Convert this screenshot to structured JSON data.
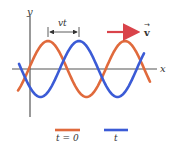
{
  "diagram": {
    "type": "traveling-wave",
    "axes": {
      "x_label": "x",
      "y_label": "y"
    },
    "displacement_label": "vt",
    "velocity_label": "v",
    "velocity_vector_mark": "→",
    "legend": [
      {
        "label": "t = 0",
        "color": "#e06a3c"
      },
      {
        "label": "t",
        "color": "#3b5bd6"
      }
    ],
    "colors": {
      "wave_t0": "#e06a3c",
      "wave_t": "#3b5bd6",
      "velocity_arrow": "#d9434a",
      "axis": "#555555",
      "bracket": "#333333"
    },
    "wave": {
      "amplitude_px": 28,
      "wavelength_px": 77,
      "shift_px": 31,
      "baseline_y": 69
    }
  }
}
